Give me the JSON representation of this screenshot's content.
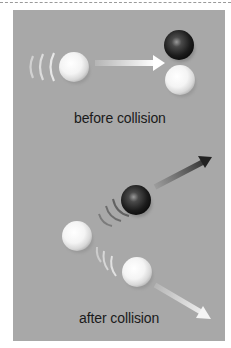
{
  "figure": {
    "type": "collision diagram",
    "background_color": "#a8a8a8",
    "sections": [
      {
        "caption": "before collision",
        "objects": [
          {
            "kind": "ball",
            "color": "white",
            "cx": 74,
            "cy": 67,
            "r": 15,
            "state": "moving",
            "motion_arcs": 3
          },
          {
            "kind": "arrow",
            "color": "white",
            "from": [
              95,
              63
            ],
            "to": [
              164,
              63
            ]
          },
          {
            "kind": "ball",
            "color": "black",
            "cx": 179,
            "cy": 45,
            "r": 15,
            "state": "at rest"
          },
          {
            "kind": "ball",
            "color": "white",
            "cx": 180,
            "cy": 80,
            "r": 15,
            "state": "at rest"
          }
        ]
      },
      {
        "caption": "after collision",
        "objects": [
          {
            "kind": "ball",
            "color": "black",
            "cx": 136,
            "cy": 200,
            "r": 15,
            "state": "moving",
            "motion_arcs": 3
          },
          {
            "kind": "arrow",
            "color": "black",
            "from": [
              155,
              187
            ],
            "to": [
              212,
              157
            ]
          },
          {
            "kind": "ball",
            "color": "white",
            "cx": 77,
            "cy": 236,
            "r": 15,
            "state": "at rest"
          },
          {
            "kind": "ball",
            "color": "white",
            "cx": 137,
            "cy": 272,
            "r": 15,
            "state": "moving",
            "motion_arcs": 3
          },
          {
            "kind": "arrow",
            "color": "white",
            "from": [
              155,
              285
            ],
            "to": [
              210,
              318
            ]
          }
        ]
      }
    ]
  },
  "labels": {
    "before": "before collision",
    "after": "after collision"
  }
}
